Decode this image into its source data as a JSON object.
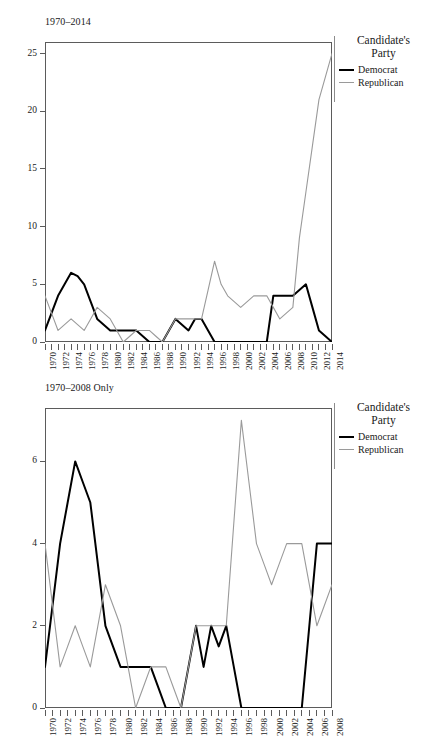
{
  "figure": {
    "legend": {
      "title_line1": "Candidate's",
      "title_line2": "Party",
      "items": [
        {
          "label": "Democrat",
          "color": "#000000"
        },
        {
          "label": "Republican",
          "color": "#9a9a9a"
        }
      ]
    }
  },
  "chart_data": [
    {
      "type": "line",
      "title": "1970–2014",
      "xlabel": "",
      "ylabel": "",
      "grid": false,
      "legend_position": "right",
      "legend_title": "Candidate's Party",
      "x": [
        1970,
        1971,
        1972,
        1973,
        1974,
        1975,
        1976,
        1977,
        1978,
        1979,
        1980,
        1981,
        1982,
        1983,
        1984,
        1985,
        1986,
        1987,
        1988,
        1989,
        1990,
        1991,
        1992,
        1993,
        1994,
        1995,
        1996,
        1997,
        1998,
        1999,
        2000,
        2001,
        2002,
        2003,
        2004,
        2005,
        2006,
        2007,
        2008,
        2009,
        2010,
        2011,
        2012,
        2013,
        2014
      ],
      "xticklabels": [
        "1970",
        "1972",
        "1974",
        "1976",
        "1978",
        "1980",
        "1982",
        "1984",
        "1986",
        "1988",
        "1990",
        "1992",
        "1994",
        "1996",
        "1998",
        "2000",
        "2002",
        "2004",
        "2006",
        "2008",
        "2010",
        "2012",
        "2014"
      ],
      "xlim": [
        1970,
        2014
      ],
      "ylim": [
        0,
        26
      ],
      "yticks": [
        0,
        5,
        10,
        15,
        20,
        25
      ],
      "yticklabels": [
        "0",
        "5",
        "10",
        "15",
        "20",
        "25"
      ],
      "series": [
        {
          "name": "Democrat",
          "color": "#000000",
          "values": [
            1,
            2.5,
            4,
            5,
            6,
            5.7,
            5,
            3.5,
            2,
            1.5,
            1,
            1,
            1,
            1,
            1,
            0.5,
            0,
            0,
            0,
            1,
            2,
            1.5,
            1,
            2,
            2,
            1,
            0,
            0,
            0,
            0,
            0,
            0,
            0,
            0,
            0,
            4,
            4,
            4,
            4,
            4.5,
            5,
            3,
            1,
            0.5,
            0
          ]
        },
        {
          "name": "Republican",
          "color": "#9a9a9a",
          "values": [
            4,
            2.5,
            1,
            1.5,
            2,
            1.5,
            1,
            2,
            3,
            2.5,
            2,
            1,
            0,
            0.5,
            1,
            1,
            1,
            0.5,
            0,
            1,
            2,
            2,
            2,
            2,
            2,
            4.5,
            7,
            5,
            4,
            3.5,
            3,
            3.5,
            4,
            4,
            4,
            3,
            2,
            2.5,
            3,
            9,
            13,
            17,
            21,
            23,
            25
          ]
        }
      ]
    },
    {
      "type": "line",
      "title": "1970–2008 Only",
      "xlabel": "",
      "ylabel": "",
      "grid": false,
      "legend_position": "right",
      "legend_title": "Candidate's Party",
      "x": [
        1970,
        1971,
        1972,
        1973,
        1974,
        1975,
        1976,
        1977,
        1978,
        1979,
        1980,
        1981,
        1982,
        1983,
        1984,
        1985,
        1986,
        1987,
        1988,
        1989,
        1990,
        1991,
        1992,
        1993,
        1994,
        1995,
        1996,
        1997,
        1998,
        1999,
        2000,
        2001,
        2002,
        2003,
        2004,
        2005,
        2006,
        2007,
        2008
      ],
      "xticklabels": [
        "1970",
        "1972",
        "1974",
        "1976",
        "1978",
        "1980",
        "1982",
        "1984",
        "1986",
        "1988",
        "1990",
        "1992",
        "1994",
        "1996",
        "1998",
        "2000",
        "2002",
        "2004",
        "2006",
        "2008"
      ],
      "xlim": [
        1970,
        2008
      ],
      "ylim": [
        0,
        7.3
      ],
      "yticks": [
        0,
        2,
        4,
        6
      ],
      "yticklabels": [
        "0",
        "2",
        "4",
        "6"
      ],
      "series": [
        {
          "name": "Democrat",
          "color": "#000000",
          "values": [
            1,
            2.5,
            4,
            5,
            6,
            5.5,
            5,
            3.5,
            2,
            1.5,
            1,
            1,
            1,
            1,
            1,
            0.5,
            0,
            0,
            0,
            1,
            2,
            1,
            2,
            1.5,
            2,
            1,
            0,
            0,
            0,
            0,
            0,
            0,
            0,
            0,
            0,
            2,
            4,
            4,
            4
          ]
        },
        {
          "name": "Republican",
          "color": "#9a9a9a",
          "values": [
            4,
            2.5,
            1,
            1.5,
            2,
            1.5,
            1,
            2,
            3,
            2.5,
            2,
            1,
            0,
            0.5,
            1,
            1,
            1,
            0.5,
            0,
            1,
            2,
            2,
            2,
            2,
            2,
            4.5,
            7,
            5.5,
            4,
            3.5,
            3,
            3.5,
            4,
            4,
            4,
            3,
            2,
            2.5,
            3
          ]
        }
      ]
    }
  ]
}
